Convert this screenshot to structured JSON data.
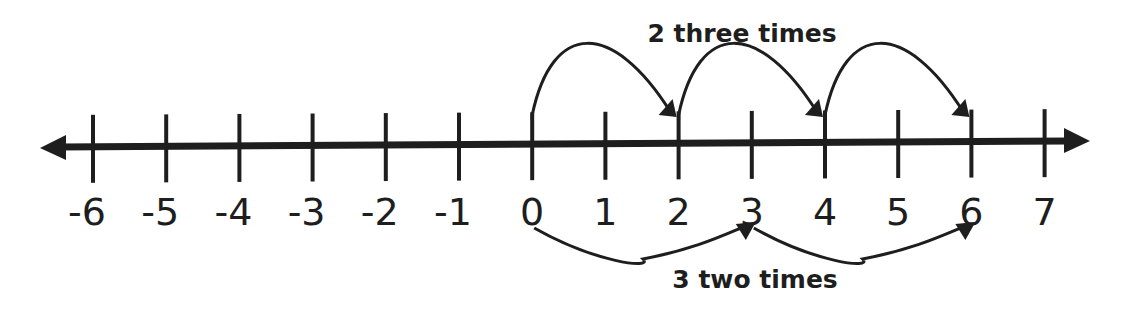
{
  "diagram": {
    "type": "number_line",
    "min": -6,
    "max": 7,
    "tick_labels": [
      "-6",
      "-5",
      "-4",
      "-3",
      "-2",
      "-1",
      "0",
      "1",
      "2",
      "3",
      "4",
      "5",
      "6",
      "7"
    ],
    "top_caption": "2 three times",
    "bottom_caption": "3 two times",
    "top_jumps": [
      {
        "from": 0,
        "to": 2
      },
      {
        "from": 2,
        "to": 4
      },
      {
        "from": 4,
        "to": 6
      }
    ],
    "bottom_jumps": [
      {
        "from": 0,
        "to": 3
      },
      {
        "from": 3,
        "to": 6
      }
    ],
    "colors": {
      "stroke": "#1e1e1e",
      "background": "#ffffff"
    }
  }
}
